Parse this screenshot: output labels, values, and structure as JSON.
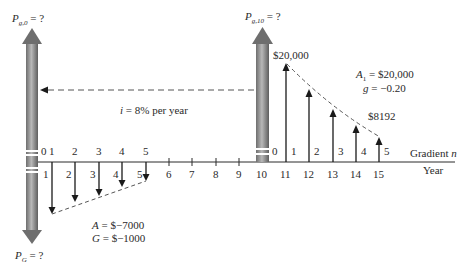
{
  "figure": {
    "type": "cash-flow-diagram",
    "interest_label": "i = 8% per year",
    "axis_label_gradient": "Gradient n",
    "axis_label_year": "Year",
    "left_series": {
      "top_label_main": "P",
      "top_label_sub": "g,0",
      "top_label_suffix": " = ?",
      "bottom_label_main": "P",
      "bottom_label_sub": "G",
      "bottom_label_suffix": " = ?",
      "A_label": "A = $−7000",
      "G_label": "G = $−1000",
      "gradient_n": [
        "0",
        "1",
        "2",
        "3",
        "4",
        "5"
      ],
      "years": [
        "1",
        "2",
        "3",
        "4",
        "5"
      ]
    },
    "right_series": {
      "top_label_main": "P",
      "top_label_sub": "g,10",
      "top_label_suffix": " = ?",
      "first_value_label": "$20,000",
      "last_value_label": "$8192",
      "A1_label_main": "A",
      "A1_label_sub": "1",
      "A1_label_suffix": " = $20,000",
      "g_label": "g = −0.20",
      "gradient_n": [
        "0",
        "1",
        "2",
        "3",
        "4",
        "5"
      ]
    },
    "year_ticks": [
      "6",
      "7",
      "8",
      "9",
      "10",
      "11",
      "12",
      "13",
      "14",
      "15"
    ],
    "colors": {
      "line": "#2a2a2a",
      "arrow_gray_light": "#b8b8b8",
      "arrow_gray_dark": "#6e6e6e",
      "dashed": "#555555"
    }
  }
}
